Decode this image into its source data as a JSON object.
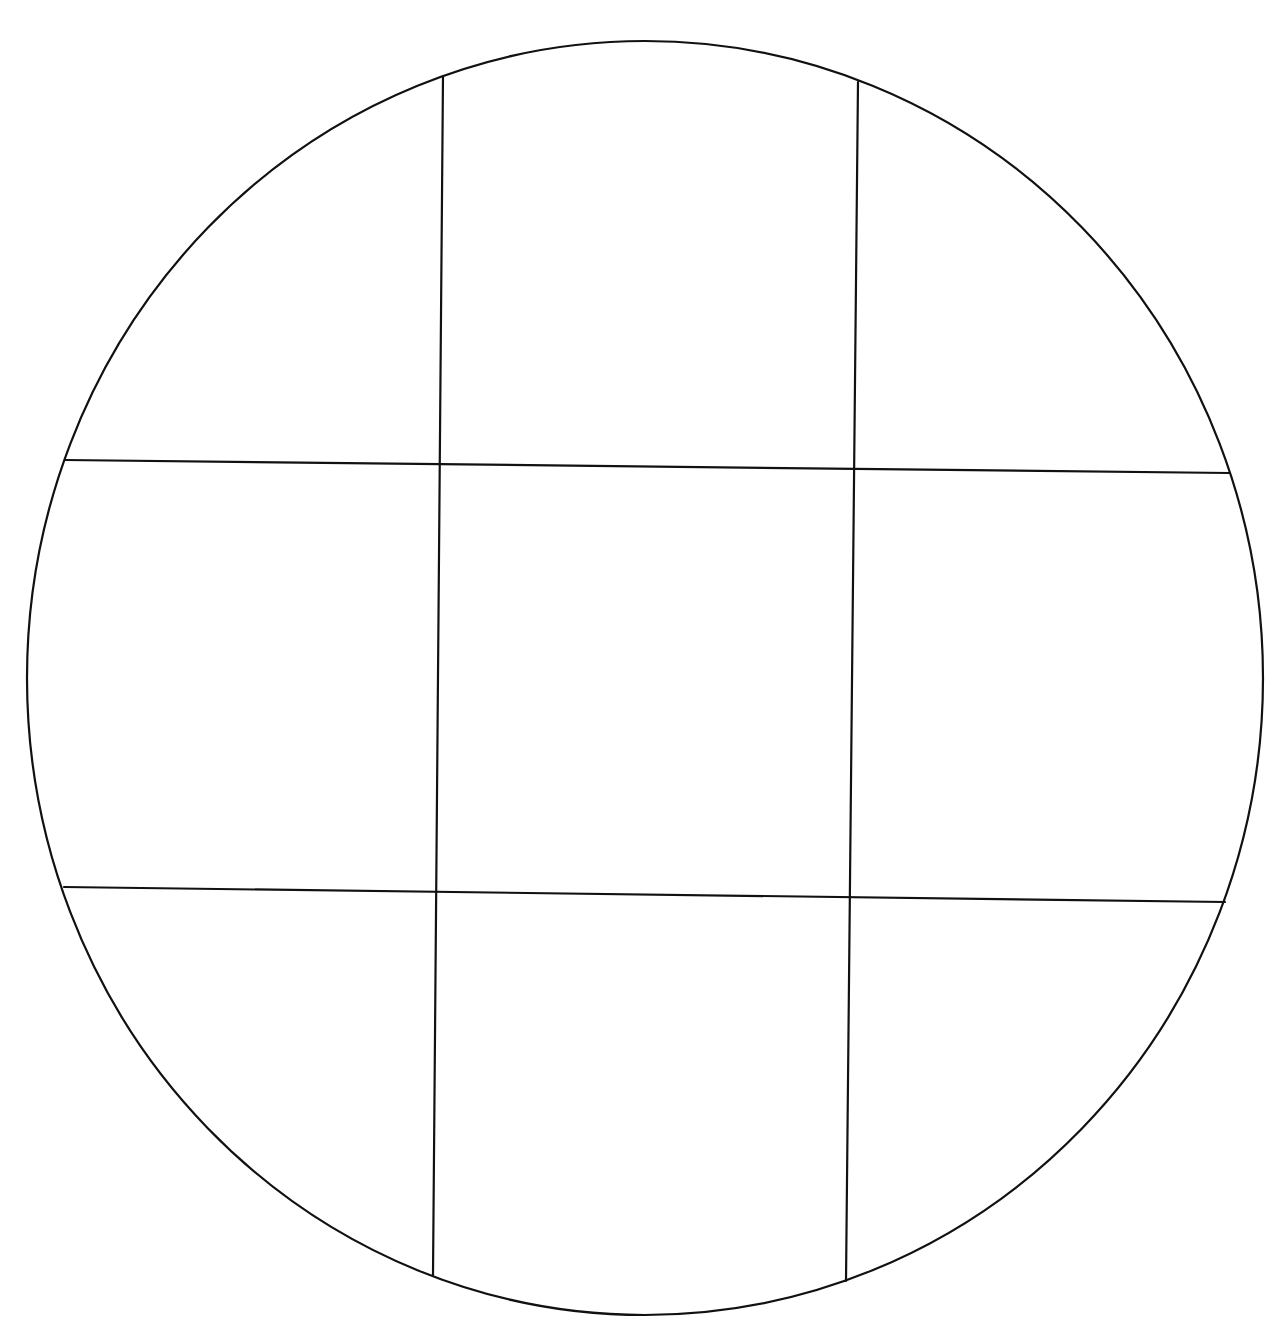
{
  "diagram": {
    "type": "circle-grid",
    "stroke_color": "#111111",
    "background_color": "#ffffff",
    "circle": {
      "cx": 645,
      "cy": 678,
      "rx": 618,
      "ry": 637
    },
    "lines": [
      {
        "id": "vertical-1",
        "x1": 443,
        "y1": 76,
        "x2": 433,
        "y2": 1275
      },
      {
        "id": "vertical-2",
        "x1": 858,
        "y1": 82,
        "x2": 846,
        "y2": 1281
      },
      {
        "id": "horizontal-1",
        "x1": 65,
        "y1": 460,
        "x2": 1229,
        "y2": 473
      },
      {
        "id": "horizontal-2",
        "x1": 64,
        "y1": 887,
        "x2": 1225,
        "y2": 902
      }
    ],
    "regions": 9
  }
}
